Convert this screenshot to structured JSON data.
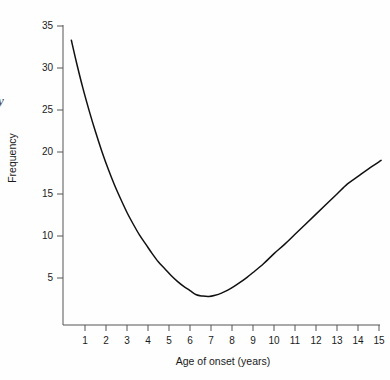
{
  "figure": {
    "background_color": "#fefefe",
    "line_color": "#111111",
    "axis_color": "#555555",
    "edge_annotation": "y"
  },
  "chart_data": {
    "type": "line",
    "title": "",
    "xlabel": "Age of onset (years)",
    "ylabel": "Frequency",
    "xlim": [
      0.15,
      15.3
    ],
    "ylim": [
      0,
      35
    ],
    "grid": false,
    "legend": null,
    "xticks": [
      1,
      2,
      3,
      4,
      5,
      6,
      7,
      8,
      9,
      10,
      11,
      12,
      13,
      14,
      15
    ],
    "xticklabels": [
      "1",
      "2",
      "3",
      "4",
      "5",
      "6",
      "7",
      "8",
      "9",
      "10",
      "11",
      "12",
      "13",
      "14",
      "15"
    ],
    "yticks": [
      5,
      10,
      15,
      20,
      25,
      30,
      35
    ],
    "yticklabels": [
      "5",
      "10",
      "15",
      "20",
      "25",
      "30",
      "35"
    ],
    "series": [
      {
        "name": "Frequency by age of onset",
        "x": [
          0.35,
          0.6,
          0.9,
          1.2,
          1.5,
          1.8,
          2.1,
          2.4,
          2.7,
          3.0,
          3.3,
          3.6,
          3.9,
          4.2,
          4.5,
          4.8,
          5.1,
          5.4,
          5.7,
          6.0,
          6.3,
          6.6,
          6.9,
          7.2,
          7.5,
          7.8,
          8.1,
          8.4,
          8.7,
          9.0,
          9.5,
          10.0,
          10.5,
          11.0,
          11.5,
          12.0,
          12.5,
          13.0,
          13.5,
          14.0,
          14.5,
          15.1
        ],
        "y": [
          33.3,
          30.6,
          27.6,
          24.9,
          22.4,
          20.1,
          18.0,
          16.1,
          14.4,
          12.8,
          11.4,
          10.1,
          9.0,
          7.9,
          6.9,
          6.1,
          5.3,
          4.6,
          4.0,
          3.5,
          3.0,
          2.85,
          2.8,
          2.95,
          3.2,
          3.55,
          4.0,
          4.5,
          5.05,
          5.65,
          6.7,
          7.9,
          9.0,
          10.2,
          11.4,
          12.6,
          13.8,
          15.0,
          16.2,
          17.1,
          18.0,
          19.0
        ]
      }
    ],
    "minimum_point": {
      "x": 6.3,
      "y": 2.8
    },
    "start_point": {
      "x": 0.35,
      "y": 33.3
    },
    "end_point": {
      "x": 15.1,
      "y": 19.0
    }
  }
}
